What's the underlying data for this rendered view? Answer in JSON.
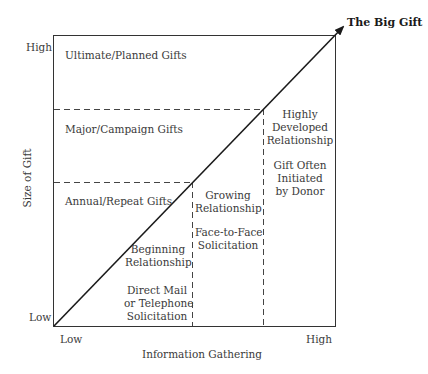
{
  "diagram": {
    "type": "donor-relationship-gift-matrix",
    "arrow_label": "The Big Gift",
    "y_axis": {
      "label": "Size of Gift",
      "high": "High",
      "low": "Low"
    },
    "x_axis": {
      "label": "Information Gathering",
      "low": "Low",
      "high": "High"
    },
    "gift_levels": [
      {
        "label": "Ultimate/Planned Gifts"
      },
      {
        "label": "Major/Campaign Gifts"
      },
      {
        "label": "Annual/Repeat Gifts"
      }
    ],
    "stages": [
      {
        "relationship": [
          "Beginning",
          "Relationship"
        ],
        "method": [
          "Direct Mail",
          "or Telephone",
          "Solicitation"
        ]
      },
      {
        "relationship": [
          "Growing",
          "Relationship"
        ],
        "method": [
          "Face-to-Face",
          "Solicitation"
        ]
      },
      {
        "relationship": [
          "Highly",
          "Developed",
          "Relationship"
        ],
        "method": [
          "Gift Often",
          "Initiated",
          "by Donor"
        ]
      }
    ],
    "colors": {
      "line": "#1a1a1a",
      "text": "#3a3a3a",
      "background": "#ffffff"
    }
  }
}
